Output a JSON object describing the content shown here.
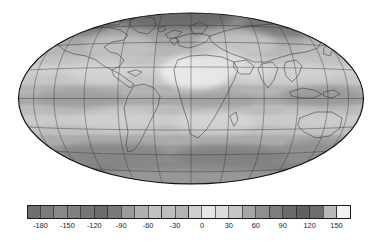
{
  "figure": {
    "title": "",
    "background_color": "#ffffff",
    "outline_color": "#1a1a1a"
  },
  "map": {
    "projection": "mollweide",
    "ellipse": {
      "cx": 191,
      "cy": 98.5,
      "rx": 173,
      "ry": 86
    },
    "graticule": {
      "meridian_step_deg": 30,
      "parallel_step_deg": 20,
      "line_color": "#3a3a3a",
      "visible": true
    },
    "coastlines_color": "#2a2a2a",
    "outline_color": "#111111"
  },
  "chart_data": {
    "type": "heatmap",
    "title": "",
    "subtitle": "",
    "xlabel": "",
    "ylabel": "",
    "projection": "mollweide",
    "grid": true,
    "legend_position": "bottom",
    "colorbar": {
      "orientation": "horizontal",
      "vmin": -195,
      "vmax": 165,
      "step": 15,
      "tick_labels": [
        "-180",
        "-150",
        "-120",
        "-90",
        "-60",
        "-30",
        "0",
        "30",
        "60",
        "90",
        "120",
        "150"
      ],
      "tick_values": [
        -180,
        -150,
        -120,
        -90,
        -60,
        -30,
        0,
        30,
        60,
        90,
        120,
        150
      ],
      "cell_count": 24,
      "cell_colors": [
        "#6f6f6f",
        "#7b7b7b",
        "#888888",
        "#818181",
        "#757575",
        "#6c6c6c",
        "#7a7a7a",
        "#9a9a9a",
        "#b0b0b0",
        "#c2c2c2",
        "#bdbdbd",
        "#b4b4b4",
        "#cfcfcf",
        "#e6e6e6",
        "#dcdcdc",
        "#c6c6c6",
        "#a5a5a5",
        "#8f8f8f",
        "#7d7d7d",
        "#6a6a6a",
        "#606060",
        "#6d6d6d",
        "#b8b8b8",
        "#f2f2f2"
      ],
      "frame_color": "#1a1a1a",
      "label_color": "#1a1a1a"
    },
    "field_description": "Grayscale shaded global field over a Mollweide projection world map with coastlines and a 30-degree meridian / 20-degree parallel graticule.",
    "latitude_band_values": [
      {
        "lat_center": 80,
        "value": -105
      },
      {
        "lat_center": 60,
        "value": -30
      },
      {
        "lat_center": 40,
        "value": 15
      },
      {
        "lat_center": 20,
        "value": 75
      },
      {
        "lat_center": 0,
        "value": 30
      },
      {
        "lat_center": -20,
        "value": 60
      },
      {
        "lat_center": -40,
        "value": -15
      },
      {
        "lat_center": -60,
        "value": -75
      },
      {
        "lat_center": -80,
        "value": -60
      }
    ]
  }
}
